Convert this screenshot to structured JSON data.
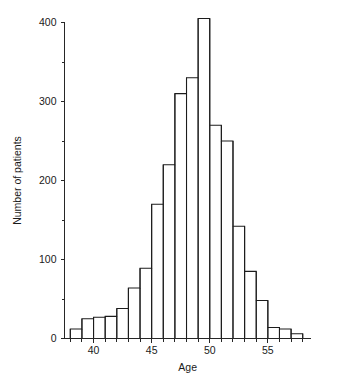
{
  "chart_data": {
    "type": "bar",
    "title": "",
    "subtitle": "",
    "xlabel": "Age",
    "ylabel": "Number of patients",
    "xlim": [
      37.5,
      58.5
    ],
    "ylim": [
      0,
      400
    ],
    "grid": false,
    "legend": null,
    "bin_width": 1,
    "x_tick_labels": [
      "40",
      "45",
      "50",
      "55"
    ],
    "x_tick_values": [
      40,
      45,
      50,
      55
    ],
    "x_minor_tick_values": [
      38,
      39,
      41,
      42,
      43,
      44,
      46,
      47,
      48,
      49,
      51,
      52,
      53,
      54,
      56,
      57,
      58
    ],
    "y_tick_labels": [
      "0",
      "100",
      "200",
      "300",
      "400"
    ],
    "y_tick_values": [
      0,
      100,
      200,
      300,
      400
    ],
    "y_minor_tick_values": [
      50,
      150,
      250,
      350
    ],
    "categories": [
      38,
      39,
      40,
      41,
      42,
      43,
      44,
      45,
      46,
      47,
      48,
      49,
      50,
      51,
      52,
      53,
      54,
      55,
      56,
      57
    ],
    "bin_starts": [
      38,
      39,
      40,
      41,
      42,
      43,
      44,
      45,
      46,
      47,
      48,
      49,
      50,
      51,
      52,
      53,
      54,
      55,
      56,
      57
    ],
    "bin_ends": [
      39,
      40,
      41,
      42,
      43,
      44,
      45,
      46,
      47,
      48,
      49,
      50,
      51,
      52,
      53,
      54,
      55,
      56,
      57,
      58
    ],
    "values": [
      12,
      25,
      27,
      28,
      38,
      64,
      89,
      170,
      220,
      310,
      330,
      405,
      270,
      250,
      142,
      85,
      48,
      14,
      12,
      6
    ],
    "peak_bin": 49,
    "peak_value": 405
  },
  "axes": {
    "y_title": "Number of patients",
    "x_title": "Age"
  },
  "colors": {
    "bar_stroke": "#1c1c1c",
    "axis": "#262626",
    "background": "#ffffff",
    "text": "#1a1a1a"
  }
}
